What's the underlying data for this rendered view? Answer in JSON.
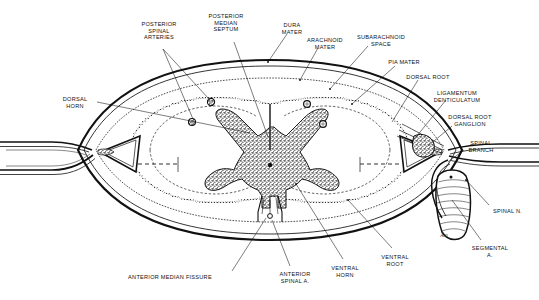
{
  "figure": {
    "background_color": "#ffffff",
    "ink_color": "#111111",
    "gray_matter_color": "#4a4a4a"
  },
  "labels": [
    {
      "id": "posterior-spinal-arteries",
      "text": "POSTERIOR\nSPINAL\nARTERIES",
      "x": 159,
      "y": 21,
      "align": "center"
    },
    {
      "id": "posterior-median-septum",
      "text": "POSTERIOR\nMEDIAN\nSEPTUM",
      "x": 226,
      "y": 13,
      "align": "center"
    },
    {
      "id": "dura-mater",
      "text": "DURA\nMATER",
      "x": 292,
      "y": 22,
      "align": "center"
    },
    {
      "id": "arachnoid-mater",
      "text": "ARACHNOID\nMATER",
      "x": 325,
      "y": 37,
      "align": "center"
    },
    {
      "id": "subarachnoid-space",
      "text": "SUBARACHNOID\nSPACE",
      "x": 381,
      "y": 34,
      "align": "center"
    },
    {
      "id": "pia-mater",
      "text": "PIA MATER",
      "x": 404,
      "y": 59,
      "align": "center"
    },
    {
      "id": "dorsal-root",
      "text": "DORSAL ROOT",
      "x": 428,
      "y": 74,
      "align": "center"
    },
    {
      "id": "ligamentum-denticulatum",
      "text": "LIGAMENTUM\nDENTICULATUM",
      "x": 457,
      "y": 90,
      "align": "center"
    },
    {
      "id": "dorsal-root-ganglion",
      "text": "DORSAL ROOT\nGANGLION",
      "x": 470,
      "y": 114,
      "align": "center"
    },
    {
      "id": "spinal-branch",
      "text": "SPINAL\nBRANCH",
      "x": 481,
      "y": 140,
      "align": "center"
    },
    {
      "id": "spinal-nerve",
      "text": "SPINAL N.",
      "x": 493,
      "y": 208,
      "align": "left"
    },
    {
      "id": "segmental-artery",
      "text": "SEGMENTAL\nA.",
      "x": 490,
      "y": 245,
      "align": "center"
    },
    {
      "id": "dorsal-horn",
      "text": "DORSAL\nHORN",
      "x": 75,
      "y": 96,
      "align": "center"
    },
    {
      "id": "anterior-median-fissure",
      "text": "ANTERIOR MEDIAN FISSURE",
      "x": 170,
      "y": 274,
      "align": "center"
    },
    {
      "id": "anterior-spinal-artery",
      "text": "ANTERIOR\nSPINAL A.",
      "x": 295,
      "y": 271,
      "align": "center"
    },
    {
      "id": "ventral-horn",
      "text": "VENTRAL\nHORN",
      "x": 345,
      "y": 265,
      "align": "center"
    },
    {
      "id": "ventral-root",
      "text": "VENTRAL\nROOT",
      "x": 395,
      "y": 254,
      "align": "center"
    }
  ],
  "annotation_marks": [
    {
      "id": "nerve-sheath-mark",
      "text": "Ä.n",
      "x": 444,
      "y": 232
    }
  ]
}
